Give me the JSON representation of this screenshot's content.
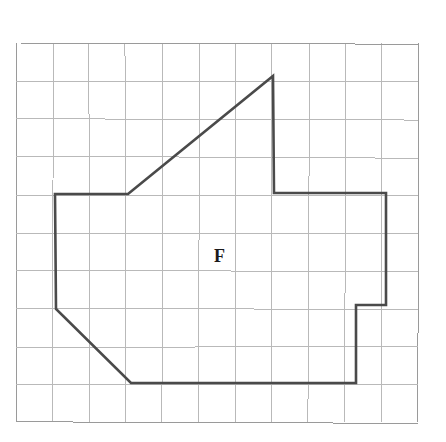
{
  "figure": {
    "kind": "grid-polygon-diagram",
    "canvas": {
      "width": 446,
      "height": 442,
      "background": "#ffffff"
    },
    "grid": {
      "name": "square-grid",
      "origin_x": 16,
      "origin_y": 43,
      "cell_width": 36.55,
      "cell_height": 37.9,
      "columns": 11,
      "rows": 10,
      "line_color": "#b9b9b9",
      "line_width": 1,
      "border_color": "#9a9a9a"
    },
    "polygon": {
      "name": "shape-F",
      "label": "F",
      "label_x": 214,
      "label_y": 247,
      "stroke_color": "#4a4a4a",
      "stroke_width": 2.6,
      "fill": "none",
      "closed": true,
      "vertices_px": [
        [
          55,
          194
        ],
        [
          128,
          194
        ],
        [
          273,
          76
        ],
        [
          274,
          193
        ],
        [
          386,
          193
        ],
        [
          386,
          305
        ],
        [
          356,
          305
        ],
        [
          356,
          383
        ],
        [
          131,
          383
        ],
        [
          56,
          309
        ]
      ],
      "vertices_grid": [
        [
          1,
          4
        ],
        [
          3,
          4
        ],
        [
          7,
          1
        ],
        [
          7,
          4
        ],
        [
          10,
          4
        ],
        [
          10,
          7
        ],
        [
          9.3,
          7
        ],
        [
          9.3,
          9
        ],
        [
          3.1,
          9
        ],
        [
          1,
          7
        ]
      ]
    }
  }
}
